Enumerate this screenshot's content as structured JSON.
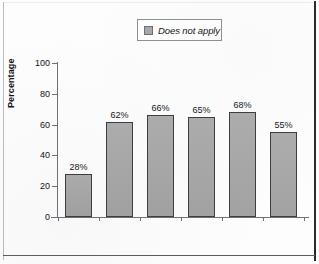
{
  "chart_data": {
    "type": "bar",
    "title": "",
    "subtitle": "",
    "xlabel": "",
    "ylabel": "Percentage",
    "ylim": [
      0,
      100
    ],
    "yticks": [
      "0",
      "20",
      "40",
      "60",
      "80",
      "100"
    ],
    "grid": false,
    "legend_position": "top-center",
    "legend": [
      {
        "label": "Does not apply",
        "color": "#a9a9a9"
      }
    ],
    "categories": [
      "Muslim",
      "Protestant",
      "Catholic",
      "Jewish",
      "Mormon",
      "No religion/\natheist/\nagnostic"
    ],
    "series": [
      {
        "name": "Does not apply",
        "values": [
          28,
          62,
          66,
          65,
          68,
          55
        ],
        "data_labels": [
          "28%",
          "62%",
          "66%",
          "65%",
          "68%",
          "55%"
        ]
      }
    ]
  },
  "legend_box": {
    "swatch_name": "legend-swatch",
    "label": "Does not apply"
  },
  "axis": {
    "y_title": "Percentage",
    "y_tick_labels": [
      "100",
      "80",
      "60",
      "40",
      "20",
      "0"
    ],
    "x_tick_labels": [
      "Muslim",
      "Protestant",
      "Catholic",
      "Jewish",
      "Mormon",
      "No religion/"
    ],
    "x_tick_extra": [
      "atheist/",
      "agnostic"
    ]
  },
  "bars": [
    {
      "category": "Muslim",
      "value": 28,
      "label": "28%"
    },
    {
      "category": "Protestant",
      "value": 62,
      "label": "62%"
    },
    {
      "category": "Catholic",
      "value": 66,
      "label": "66%"
    },
    {
      "category": "Jewish",
      "value": 65,
      "label": "65%"
    },
    {
      "category": "Mormon",
      "value": 68,
      "label": "68%"
    },
    {
      "category": "No religion/atheist/agnostic",
      "value": 55,
      "label": "55%"
    }
  ],
  "colors": {
    "bar_fill": "#a9a9a9",
    "bar_border": "#3c3e42",
    "axis": "#6f7276",
    "text": "#15161a",
    "frame": "#2b2b2d"
  }
}
